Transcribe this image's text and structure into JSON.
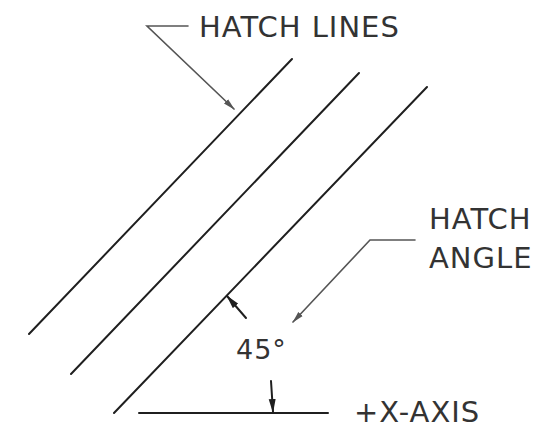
{
  "diagram": {
    "labels": {
      "hatch_lines": "HATCH LINES",
      "hatch_angle_line1": "HATCH",
      "hatch_angle_line2": "ANGLE",
      "angle_value": "45°",
      "x_axis": "+X-AXIS"
    },
    "hatch_lines": [
      {
        "x1": 29,
        "y1": 334,
        "x2": 292,
        "y2": 59
      },
      {
        "x1": 71,
        "y1": 374,
        "x2": 359,
        "y2": 73
      },
      {
        "x1": 114,
        "y1": 413,
        "x2": 427,
        "y2": 87
      }
    ],
    "x_axis_line": {
      "x1": 139,
      "y1": 413,
      "x2": 328,
      "y2": 413
    },
    "hatch_angle_deg": 45,
    "colors": {
      "line": "#1f1f1f",
      "leader": "#555555",
      "text": "#333333",
      "background": "#ffffff"
    }
  }
}
